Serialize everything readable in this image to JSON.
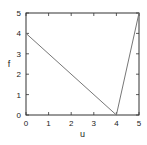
{
  "chart_data": {
    "type": "line",
    "title": "",
    "xlabel": "u",
    "ylabel": "f",
    "xlim": [
      0,
      5
    ],
    "ylim": [
      0,
      5
    ],
    "xticks": [
      "0",
      "1",
      "2",
      "3",
      "4",
      "5"
    ],
    "yticks": [
      "0",
      "1",
      "2",
      "3",
      "4",
      "5"
    ],
    "grid": false,
    "legend": null,
    "series": [
      {
        "name": "f(u)",
        "x": [
          0,
          4,
          5
        ],
        "y": [
          4,
          0,
          5
        ],
        "color": "#777777"
      }
    ]
  }
}
